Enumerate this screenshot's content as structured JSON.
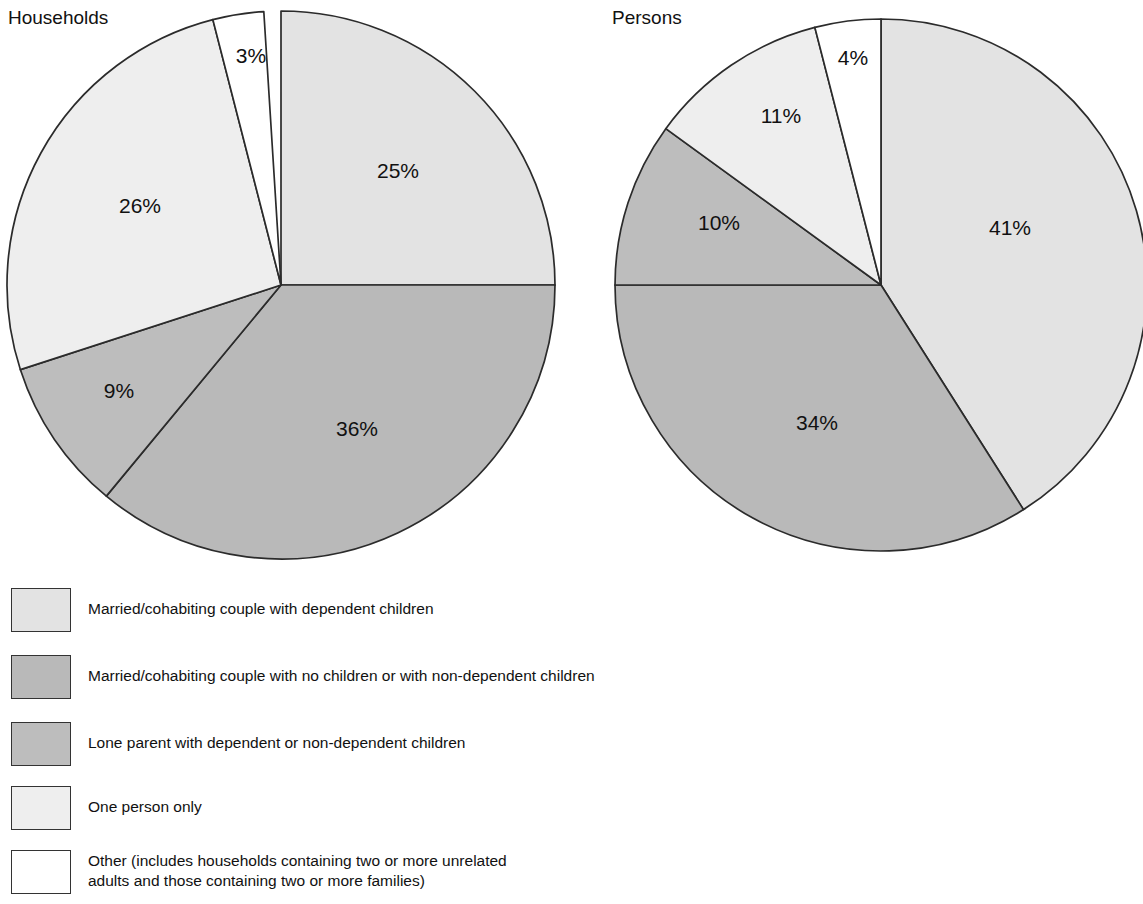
{
  "charts": [
    {
      "title": "Households",
      "labels": [
        "25%",
        "36%",
        "9%",
        "26%",
        "3%"
      ]
    },
    {
      "title": "Persons",
      "labels": [
        "41%",
        "34%",
        "10%",
        "11%",
        "4%"
      ]
    }
  ],
  "legend": {
    "items": [
      {
        "label": "Married/cohabiting couple with dependent children",
        "color": "#e3e3e3"
      },
      {
        "label": "Married/cohabiting couple with no children or with non-dependent children",
        "color": "#b9b9b9"
      },
      {
        "label": "Lone parent with dependent or non-dependent children",
        "color": "#bdbdbd"
      },
      {
        "label": "One person only",
        "color": "#eeeeee"
      },
      {
        "label": "Other (includes households containing two or more unrelated\nadults and those containing two or more families)",
        "color": "#ffffff"
      }
    ]
  },
  "chart_data": {
    "type": "pie",
    "legend_position": "bottom",
    "categories": [
      "Married/cohabiting couple with dependent children",
      "Married/cohabiting couple with no children or with non-dependent children",
      "Lone parent with dependent or non-dependent children",
      "One person only",
      "Other (includes households containing two or more unrelated adults and those containing two or more families)"
    ],
    "colors": [
      "#e3e3e3",
      "#b9b9b9",
      "#bdbdbd",
      "#eeeeee",
      "#ffffff"
    ],
    "series": [
      {
        "name": "Households",
        "values": [
          25,
          36,
          9,
          26,
          3
        ]
      },
      {
        "name": "Persons",
        "values": [
          41,
          34,
          10,
          11,
          4
        ]
      }
    ],
    "units": "percent",
    "pies": [
      {
        "name": "Households",
        "center_x": 281,
        "center_y": 285,
        "radius": 274,
        "start_angle_deg": 0,
        "direction": "clockwise",
        "slices": [
          {
            "category_index": 0,
            "value": 25,
            "label": "25%",
            "color": "#e3e3e3",
            "label_x": 398,
            "label_y": 172
          },
          {
            "category_index": 1,
            "value": 36,
            "label": "36%",
            "color": "#b9b9b9",
            "label_x": 357,
            "label_y": 430
          },
          {
            "category_index": 2,
            "value": 9,
            "label": "9%",
            "color": "#bdbdbd",
            "label_x": 119,
            "label_y": 392
          },
          {
            "category_index": 3,
            "value": 26,
            "label": "26%",
            "color": "#eeeeee",
            "label_x": 140,
            "label_y": 207
          },
          {
            "category_index": 4,
            "value": 3,
            "label": "3%",
            "color": "#ffffff",
            "label_x": 251,
            "label_y": 57
          }
        ]
      },
      {
        "name": "Persons",
        "center_x": 881,
        "center_y": 285,
        "radius": 266,
        "start_angle_deg": 0,
        "direction": "clockwise",
        "slices": [
          {
            "category_index": 0,
            "value": 41,
            "label": "41%",
            "color": "#e3e3e3",
            "label_x": 1010,
            "label_y": 229
          },
          {
            "category_index": 1,
            "value": 34,
            "label": "34%",
            "color": "#b9b9b9",
            "label_x": 817,
            "label_y": 424
          },
          {
            "category_index": 2,
            "value": 10,
            "label": "10%",
            "color": "#bdbdbd",
            "label_x": 719,
            "label_y": 224
          },
          {
            "category_index": 3,
            "value": 11,
            "label": "11%",
            "color": "#eeeeee",
            "label_x": 781,
            "label_y": 117
          },
          {
            "category_index": 4,
            "value": 4,
            "label": "4%",
            "color": "#ffffff",
            "label_x": 853,
            "label_y": 59
          }
        ]
      }
    ]
  }
}
